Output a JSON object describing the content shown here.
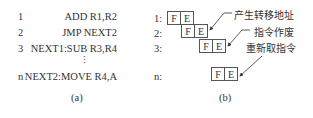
{
  "panel_a": {
    "rows": [
      {
        "num": "1",
        "instr": "ADD R1,R2"
      },
      {
        "num": "2",
        "instr": "JMP NEXT2"
      },
      {
        "num": "3",
        "instr": "NEXT1:SUB R3,R4"
      },
      {
        "num": "n",
        "instr": "NEXT2:MOVE R4,A"
      }
    ],
    "ellipsis": "⋮",
    "caption": "(a)"
  },
  "panel_b": {
    "row_labels": [
      "1:",
      "2:",
      "3:",
      "n:"
    ],
    "stage_f": "F",
    "stage_e": "E",
    "annotations": [
      "产生转移地址",
      "指令作废",
      "重新取指令"
    ],
    "caption": "(b)"
  }
}
